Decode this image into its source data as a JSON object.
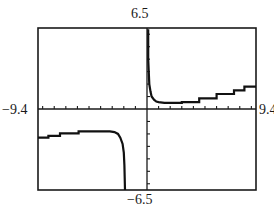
{
  "chart_data": {
    "type": "line",
    "title": "",
    "xlabel": "",
    "ylabel": "",
    "window": {
      "xmin": -9.4,
      "xmax": 9.4,
      "ymin": -6.5,
      "ymax": 6.5,
      "xscl": 1,
      "yscl": 1
    },
    "xlim": [
      -9.4,
      9.4
    ],
    "ylim": [
      -6.5,
      6.5
    ],
    "tick_labels": {
      "ymax": "6.5",
      "ymin": "−6.5",
      "xmin": "−9.4",
      "xmax": "9.4"
    },
    "grid": false,
    "legend": null,
    "series": [
      {
        "name": "right-branch",
        "points": [
          [
            0.1,
            6.4
          ],
          [
            0.1,
            4.0
          ],
          [
            0.2,
            2.0
          ],
          [
            0.3,
            1.4
          ],
          [
            0.4,
            1.0
          ],
          [
            0.6,
            0.75
          ],
          [
            0.8,
            0.6
          ],
          [
            1.0,
            0.55
          ],
          [
            1.5,
            0.5
          ],
          [
            3.0,
            0.5
          ],
          [
            3.0,
            0.55
          ],
          [
            4.5,
            0.55
          ],
          [
            4.5,
            0.85
          ],
          [
            6.0,
            0.85
          ],
          [
            6.0,
            1.2
          ],
          [
            7.5,
            1.2
          ],
          [
            7.5,
            1.5
          ],
          [
            8.4,
            1.5
          ],
          [
            8.4,
            1.8
          ],
          [
            9.4,
            1.8
          ]
        ]
      },
      {
        "name": "left-branch",
        "points": [
          [
            -9.4,
            -2.3
          ],
          [
            -8.5,
            -2.3
          ],
          [
            -8.5,
            -2.15
          ],
          [
            -7.5,
            -2.15
          ],
          [
            -7.5,
            -1.95
          ],
          [
            -5.9,
            -1.95
          ],
          [
            -5.9,
            -1.8
          ],
          [
            -3.2,
            -1.8
          ],
          [
            -2.8,
            -1.85
          ],
          [
            -2.5,
            -2.0
          ],
          [
            -2.3,
            -2.3
          ],
          [
            -2.1,
            -2.8
          ],
          [
            -2.0,
            -3.5
          ],
          [
            -1.95,
            -4.5
          ],
          [
            -1.9,
            -6.5
          ]
        ]
      }
    ],
    "x": [],
    "categories": []
  },
  "style": {
    "frame_color": "#1a1a1a",
    "axis_color": "#1a1a1a",
    "curve_color": "#111111",
    "background": "#ffffff"
  }
}
